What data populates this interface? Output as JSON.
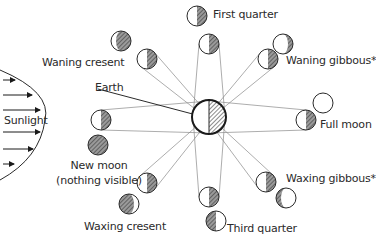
{
  "colors": {
    "ink": "#2a2a2a",
    "shadow": "#777777",
    "orbit_line": "#8a8a8a",
    "background": "#ffffff"
  },
  "sun": {
    "label": "Sunlight",
    "arrow_count": 6
  },
  "earth": {
    "label": "Earth"
  },
  "phases": [
    {
      "id": "first-quarter",
      "label": "First quarter"
    },
    {
      "id": "waning-gibbous",
      "label": "Waning gibbous*"
    },
    {
      "id": "full-moon",
      "label": "Full moon"
    },
    {
      "id": "waxing-gibbous",
      "label": "Waxing gibbous*"
    },
    {
      "id": "third-quarter",
      "label": "Third quarter"
    },
    {
      "id": "waxing-cresent",
      "label": "Waxing cresent"
    },
    {
      "id": "new-moon",
      "label": "New moon",
      "sublabel": "(nothing visible)"
    },
    {
      "id": "waning-cresent",
      "label": "Waning cresent"
    }
  ]
}
